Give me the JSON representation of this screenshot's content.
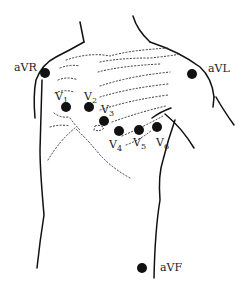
{
  "diagram": {
    "type": "ecg-electrode-placement",
    "colors": {
      "ink": "#111111",
      "background": "#ffffff"
    },
    "limb_leads": [
      {
        "id": "aVR",
        "label": "aVR",
        "dot": [
          45,
          73
        ],
        "label_pos": [
          14,
          66
        ]
      },
      {
        "id": "aVL",
        "label": "aVL",
        "dot": [
          192,
          74
        ],
        "label_pos": [
          208,
          63
        ]
      },
      {
        "id": "aVF",
        "label": "aVF",
        "dot": [
          142,
          268
        ],
        "label_pos": [
          160,
          263
        ]
      }
    ],
    "chest_leads": [
      {
        "id": "V1",
        "letter": "V",
        "sub": "1",
        "dot": [
          66,
          107
        ],
        "label_pos": [
          55,
          91
        ]
      },
      {
        "id": "V2",
        "letter": "V",
        "sub": "2",
        "dot": [
          89,
          107
        ],
        "label_pos": [
          84,
          91
        ]
      },
      {
        "id": "V3",
        "letter": "V",
        "sub": "3",
        "dot": [
          104,
          121
        ],
        "label_pos": [
          101,
          104
        ]
      },
      {
        "id": "V4",
        "letter": "V",
        "sub": "4",
        "dot": [
          119,
          131
        ],
        "label_pos": [
          110,
          139
        ]
      },
      {
        "id": "V5",
        "letter": "V",
        "sub": "5",
        "dot": [
          139,
          130
        ],
        "label_pos": [
          133,
          137
        ]
      },
      {
        "id": "V6",
        "letter": "V",
        "sub": "6",
        "dot": [
          157,
          127
        ],
        "label_pos": [
          156,
          138
        ]
      }
    ]
  }
}
